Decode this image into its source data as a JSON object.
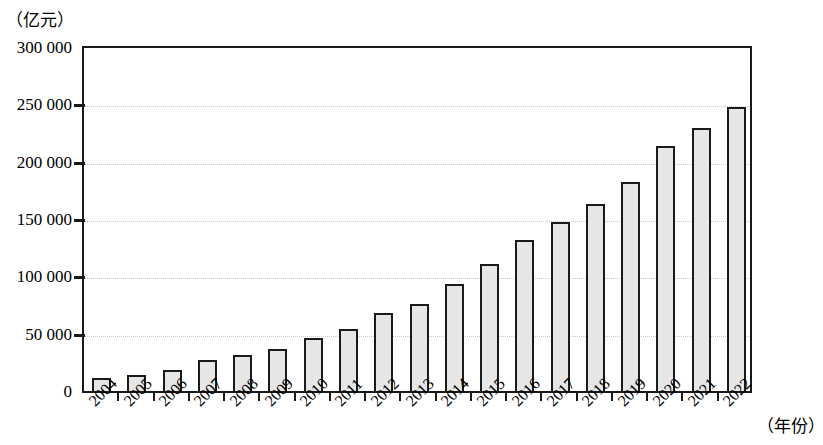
{
  "chart_data": {
    "type": "bar",
    "title": "",
    "subtitle": "",
    "xlabel": "（年份）",
    "ylabel": "（亿元）",
    "categories": [
      "2004",
      "2005",
      "2006",
      "2007",
      "2008",
      "2009",
      "2010",
      "2011",
      "2012",
      "2013",
      "2014",
      "2015",
      "2016",
      "2017",
      "2018",
      "2019",
      "2020",
      "2021",
      "2022"
    ],
    "values": [
      11000,
      14000,
      18000,
      27000,
      31000,
      37000,
      46000,
      54000,
      68000,
      76000,
      93000,
      111000,
      132000,
      147000,
      163000,
      182000,
      214000,
      229000,
      248000
    ],
    "ylim": [
      0,
      300000
    ],
    "ytick_values": [
      0,
      50000,
      100000,
      150000,
      200000,
      250000,
      300000
    ],
    "ytick_labels": [
      "0",
      "50 000",
      "100 000",
      "150 000",
      "200 000",
      "250 000",
      "300 000"
    ],
    "grid": true,
    "grid_axis": "y",
    "legend": null,
    "bar_fill_color": "#e6e6e6",
    "bar_border_color": "#1a1a1a",
    "gridline_color": "#c9c9c9",
    "axis_color": "#1a1a1a",
    "background_color": "#ffffff",
    "xtick_label_rotation": -45
  }
}
